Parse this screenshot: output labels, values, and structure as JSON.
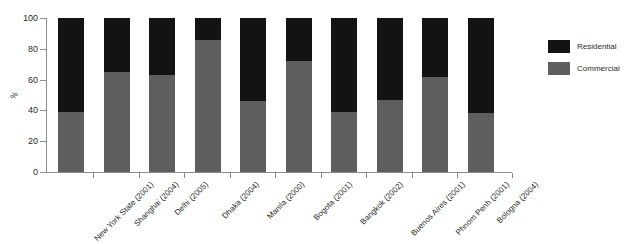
{
  "chart_data": {
    "type": "bar",
    "subtype": "stacked-percent",
    "title": "",
    "subtitle": "",
    "xlabel": "",
    "ylabel": "%",
    "ylim": [
      0,
      100
    ],
    "yticks": [
      0,
      20,
      40,
      60,
      80,
      100
    ],
    "grid": false,
    "legend_position": "right",
    "categories": [
      "New York State (2001)",
      "Shanghai (2004)",
      "Delhi (2005)",
      "Dhaka (2004)",
      "Manila (2000)",
      "Bogota (2001)",
      "Bangkok (2002)",
      "Buenos Aires (2001)",
      "Phnom Penh (2001)",
      "Bologna (2004)"
    ],
    "series": [
      {
        "name": "Commercial",
        "color": "#5e5e5e",
        "values": [
          39,
          65,
          63,
          86,
          46,
          72,
          39,
          47,
          62,
          38
        ]
      },
      {
        "name": "Residential",
        "color": "#131313",
        "values": [
          61,
          35,
          37,
          14,
          54,
          28,
          61,
          53,
          38,
          62
        ]
      }
    ]
  },
  "legend": {
    "items": [
      {
        "label": "Residential",
        "color": "#131313"
      },
      {
        "label": "Commercial",
        "color": "#5e5e5e"
      }
    ]
  },
  "axes": {
    "y_title": "%",
    "y_tick_labels": [
      "100",
      "80",
      "60",
      "40",
      "20",
      "0"
    ]
  }
}
